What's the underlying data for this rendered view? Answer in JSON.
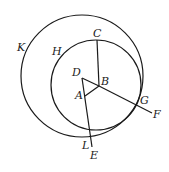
{
  "diagram": {
    "circles": [
      {
        "id": "K",
        "cx": 82,
        "cy": 76,
        "r": 61
      },
      {
        "id": "H",
        "cx": 96,
        "cy": 85,
        "r": 45
      }
    ],
    "segments": [
      {
        "from": "C",
        "to": "B"
      },
      {
        "from": "D",
        "to": "E"
      },
      {
        "from": "D",
        "to": "B"
      },
      {
        "from": "A",
        "to": "B"
      },
      {
        "from": "B",
        "to": "F"
      }
    ],
    "points": {
      "C": [
        97,
        40
      ],
      "B": [
        99,
        86
      ],
      "D": [
        82,
        78
      ],
      "A": [
        85,
        96
      ],
      "E": [
        92,
        146
      ],
      "F": [
        152,
        113
      ],
      "G": [
        138,
        104
      ],
      "L": [
        90,
        136
      ]
    },
    "labels": {
      "K": "K",
      "H": "H",
      "C": "C",
      "D": "D",
      "B": "B",
      "A": "A",
      "G": "G",
      "F": "F",
      "L": "L",
      "E": "E"
    },
    "stroke_color": "#1a1a1a"
  }
}
